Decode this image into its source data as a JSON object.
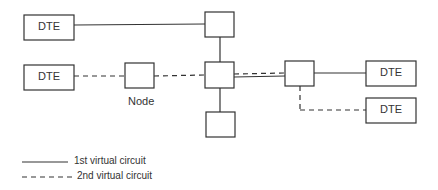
{
  "diagram": {
    "dte_labels": [
      "DTE",
      "DTE",
      "DTE",
      "DTE"
    ],
    "node_label": "Node",
    "legend": {
      "solid": "1st virtual circuit",
      "dashed": "2nd virtual circuit"
    },
    "colors": {
      "line": "#333333",
      "background": "#ffffff"
    }
  }
}
